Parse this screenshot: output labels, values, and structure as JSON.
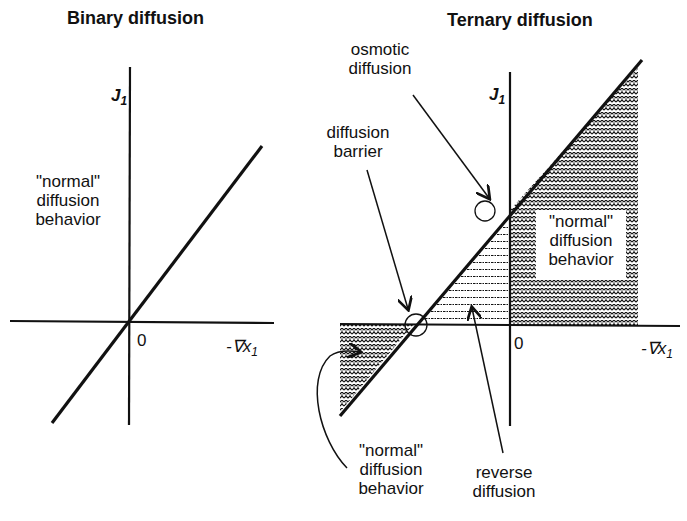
{
  "left_panel": {
    "title": "Binary diffusion",
    "y_axis_label": "J",
    "y_axis_sub": "1",
    "x_axis_label": "-∇x",
    "x_axis_sub": "1",
    "origin_label": "0",
    "region_label": [
      "\"normal\"",
      "diffusion",
      "behavior"
    ]
  },
  "right_panel": {
    "title": "Ternary diffusion",
    "y_axis_label": "J",
    "y_axis_sub": "1",
    "x_axis_label": "-∇x",
    "x_axis_sub": "1",
    "origin_label": "0",
    "annotations": {
      "osmotic": [
        "osmotic",
        "diffusion"
      ],
      "barrier": [
        "diffusion",
        "barrier"
      ],
      "normal_upper": [
        "\"normal\"",
        "diffusion",
        "behavior"
      ],
      "normal_lower": [
        "\"normal\"",
        "diffusion",
        "behavior"
      ],
      "reverse": [
        "reverse",
        "diffusion"
      ]
    }
  },
  "colors": {
    "ink": "#111111",
    "background": "#ffffff"
  }
}
